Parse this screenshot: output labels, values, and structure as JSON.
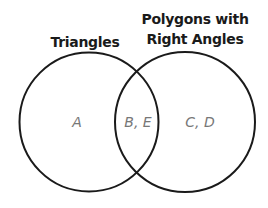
{
  "diagram": {
    "type": "venn",
    "sets": [
      {
        "name": "Triangles",
        "title_lines": [
          "Triangles"
        ]
      },
      {
        "name": "Polygons with Right Angles",
        "title_lines": [
          "Polygons with",
          "Right Angles"
        ]
      }
    ],
    "regions": {
      "left_only": "A",
      "intersection": "B, E",
      "right_only": "C, D"
    },
    "colors": {
      "stroke": "#1a1a1a",
      "title": "#1a1a1a",
      "label": "#777777"
    }
  }
}
